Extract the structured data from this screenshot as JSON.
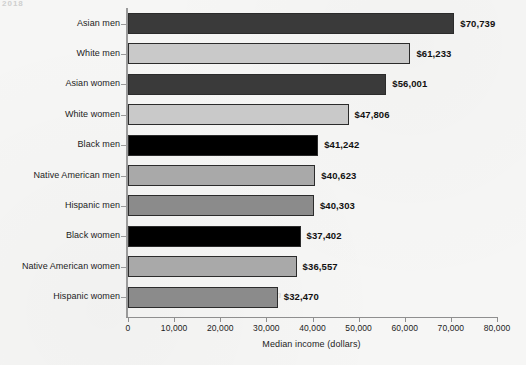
{
  "page": {
    "background_color": "#f6f6f5",
    "top_fragment": "2018"
  },
  "bleed_watermarks": [
    {
      "text": "Environment",
      "left": 215,
      "top": 171,
      "size": 13
    },
    {
      "text": "and",
      "left": 181,
      "top": 258,
      "size": 9
    },
    {
      "text": "Conservation",
      "left": 222,
      "top": 288,
      "size": 11
    }
  ],
  "chart_data": {
    "type": "bar",
    "orientation": "horizontal",
    "title": "",
    "subtitle": "",
    "xlabel": "Median income (dollars)",
    "ylabel": "",
    "xlim": [
      0,
      80000
    ],
    "ylim": null,
    "grid": false,
    "legend": null,
    "xticks": [
      0,
      10000,
      20000,
      30000,
      40000,
      50000,
      60000,
      70000,
      80000
    ],
    "xticklabels": [
      "0",
      "10,000",
      "20,000",
      "30,000",
      "40,000",
      "50,000",
      "60,000",
      "70,000",
      "80,000"
    ],
    "categories": [
      "Asian men",
      "White men",
      "Asian women",
      "White women",
      "Black men",
      "Native American men",
      "Hispanic men",
      "Black women",
      "Native American women",
      "Hispanic women"
    ],
    "values": [
      70739,
      61233,
      56001,
      47806,
      41242,
      40623,
      40303,
      37402,
      36557,
      32470
    ],
    "data_labels": [
      "$70,739",
      "$61,233",
      "$56,001",
      "$47,806",
      "$41,242",
      "$40,623",
      "$40,303",
      "$37,402",
      "$36,557",
      "$32,470"
    ],
    "bar_colors": [
      "#3a3a3a",
      "#c9c9c9",
      "#3a3a3a",
      "#c9c9c9",
      "#000000",
      "#a9a9a9",
      "#8b8b8b",
      "#000000",
      "#a9a9a9",
      "#8b8b8b"
    ],
    "group_colors": {
      "asian": "#3a3a3a",
      "white": "#c9c9c9",
      "black": "#000000",
      "native_american": "#a9a9a9",
      "hispanic": "#8b8b8b"
    },
    "bar_edge_color": "#2b2b2b"
  }
}
